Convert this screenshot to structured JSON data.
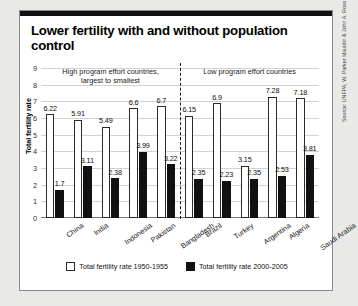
{
  "title": "Lower fertility with and without population control",
  "source": "Source: UNFPA; W. Parker Mauldin & John A. Ross",
  "sections": [
    {
      "label": "High program effort countries,\nlargest to smallest"
    },
    {
      "label": "Low program effort countries"
    }
  ],
  "legend": [
    {
      "key": "open",
      "label": "Total fertility rate 1950-1955"
    },
    {
      "key": "solid",
      "label": "Total fertility rate 2000-2005"
    }
  ],
  "chart_data": {
    "type": "bar",
    "title": "Lower fertility with and without population control",
    "xlabel": "",
    "ylabel": "Total fertility rate",
    "ylim": [
      0,
      9
    ],
    "yticks": [
      0,
      1,
      2,
      3,
      4,
      5,
      6,
      7,
      8,
      9
    ],
    "grid": true,
    "legend_position": "bottom",
    "categories": [
      "China",
      "India",
      "Indonesia",
      "Pakistan",
      "Bangladesh",
      "Brazil",
      "Turkey",
      "Argentina",
      "Algeria",
      "Saudi Arabia"
    ],
    "groups": [
      {
        "name": "High program effort countries, largest to smallest",
        "categories": [
          "China",
          "India",
          "Indonesia",
          "Pakistan",
          "Bangladesh"
        ]
      },
      {
        "name": "Low program effort countries",
        "categories": [
          "Brazil",
          "Turkey",
          "Argentina",
          "Algeria",
          "Saudi Arabia"
        ]
      }
    ],
    "series": [
      {
        "name": "Total fertility rate 1950-1955",
        "values": [
          6.22,
          5.91,
          5.49,
          6.6,
          6.7,
          6.15,
          6.9,
          3.15,
          7.28,
          7.18
        ]
      },
      {
        "name": "Total fertility rate 2000-2005",
        "values": [
          1.7,
          3.11,
          2.38,
          3.99,
          3.22,
          2.35,
          2.23,
          2.35,
          2.53,
          3.81
        ]
      }
    ],
    "value_labels": {
      "1950-1955": [
        "6.22",
        "5.91",
        "5.49",
        "6.6",
        "6.7",
        "6.15",
        "6.9",
        "3.15",
        "7.28",
        "7.18"
      ],
      "2000-2005": [
        "1.7",
        "3.11",
        "2.38",
        "3.99",
        "3.22",
        "2.35",
        "2.23",
        "2.35",
        "2.53",
        "3.81"
      ]
    }
  },
  "colors": {
    "series_1950": "#ffffff",
    "series_2000": "#111111",
    "grid": "#d2d2d2",
    "card": "#ffffff",
    "page": "#e9e9e7",
    "topbar": "#111111"
  }
}
